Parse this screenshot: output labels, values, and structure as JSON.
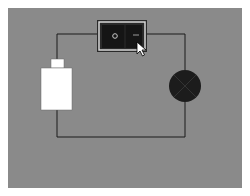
{
  "diagram": {
    "background_color": "#8a8a8a",
    "wire_color": "#1a1a1a",
    "components": [
      {
        "id": "battery",
        "label": "",
        "type": "battery",
        "color": "#ffffff"
      },
      {
        "id": "switch",
        "label": "",
        "type": "rocker-switch",
        "state": "off",
        "symbols": {
          "off": "O",
          "on": "—"
        }
      },
      {
        "id": "lamp",
        "label": "",
        "type": "lamp",
        "state": "off",
        "color": "#1c1c1c"
      }
    ]
  },
  "switch": {
    "off_symbol": "O",
    "on_symbol": "—"
  }
}
